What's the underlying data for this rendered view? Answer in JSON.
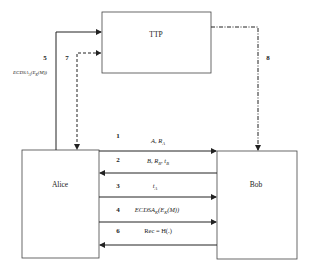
{
  "diagram": {
    "entities": {
      "ttp": "TTP",
      "alice": "Alice",
      "bob": "Bob"
    },
    "ttp_links": [
      {
        "step": "5",
        "label": "ECDSA_A(E_K(M))",
        "label_main": "ECDSA",
        "label_sub": "A",
        "label_rest": "(E",
        "label_sub2": "K",
        "label_end": "(M))",
        "from": "Alice",
        "to": "TTP",
        "style": "solid"
      },
      {
        "step": "7",
        "label": "",
        "from": "TTP",
        "to": "Alice",
        "style": "dashed"
      },
      {
        "step": "8",
        "label": "",
        "from": "TTP",
        "to": "Bob",
        "style": "dash-dot"
      }
    ],
    "messages": [
      {
        "step": "1",
        "main": "A, R",
        "sub": "A",
        "rest": "",
        "sub2": "",
        "end": "",
        "direction": "right"
      },
      {
        "step": "2",
        "main": "B, R",
        "sub": "B",
        "rest": ", t",
        "sub2": "B",
        "end": "",
        "direction": "left"
      },
      {
        "step": "3",
        "main": "t",
        "sub": "A",
        "rest": "",
        "sub2": "",
        "end": "",
        "direction": "right"
      },
      {
        "step": "4",
        "main": "ECDSA",
        "sub": "K",
        "rest": "(E",
        "sub2": "K",
        "end": "(M))",
        "direction": "right"
      },
      {
        "step": "6",
        "main": "Rec = H(.)",
        "sub": "",
        "rest": "",
        "sub2": "",
        "end": "",
        "direction": "left"
      }
    ]
  }
}
